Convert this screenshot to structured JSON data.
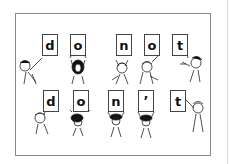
{
  "illustration": {
    "description": "Children holding letter cards showing contraction",
    "row1": {
      "phrase": "do not",
      "cards": [
        {
          "letter": "d",
          "x": 42,
          "y": 34
        },
        {
          "letter": "o",
          "x": 70,
          "y": 34
        },
        {
          "letter": "n",
          "x": 116,
          "y": 34
        },
        {
          "letter": "o",
          "x": 144,
          "y": 34
        },
        {
          "letter": "t",
          "x": 172,
          "y": 34
        }
      ]
    },
    "row2": {
      "phrase": "don't",
      "cards": [
        {
          "letter": "d",
          "x": 43,
          "y": 90
        },
        {
          "letter": "o",
          "x": 73,
          "y": 90
        },
        {
          "letter": "n",
          "x": 108,
          "y": 90
        },
        {
          "letter": "’",
          "x": 138,
          "y": 90
        },
        {
          "letter": "t",
          "x": 170,
          "y": 90
        }
      ]
    },
    "colors": {
      "border": "#8a8a8a",
      "ink": "#111111",
      "background": "#ffffff"
    }
  }
}
